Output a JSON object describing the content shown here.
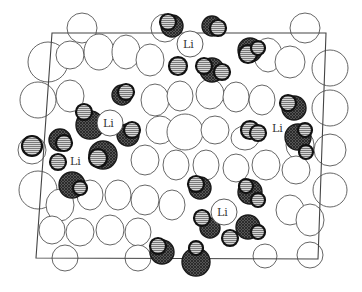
{
  "figure": {
    "type": "crystal-structure-projection",
    "unit_cell": {
      "corners": [
        [
          52,
          33
        ],
        [
          326,
          33
        ],
        [
          318,
          259
        ],
        [
          36,
          258
        ]
      ]
    },
    "labels": [
      {
        "text": "Li",
        "x": 190,
        "y": 44,
        "r": 13,
        "circle": true
      },
      {
        "text": "Li",
        "x": 110,
        "y": 123,
        "r": 13,
        "circle": true
      },
      {
        "text": "Li",
        "x": 224,
        "y": 212,
        "r": 13,
        "circle": true
      },
      {
        "text": "Li",
        "x": 278,
        "y": 128,
        "r": 0,
        "circle": false
      },
      {
        "text": "Li",
        "x": 76,
        "y": 161,
        "r": 0,
        "circle": false
      }
    ],
    "colors": {
      "background": "#ffffff",
      "framework_outline": "#555555",
      "dark_atom": "#3a3a3a",
      "light_atom_stripe": "#9a9a9a"
    }
  }
}
